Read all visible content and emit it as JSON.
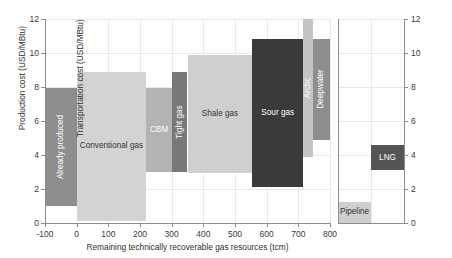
{
  "chart_data": {
    "type": "bar",
    "title": "",
    "subtitle": "",
    "panels": [
      {
        "name": "production-cost-panel",
        "xlabel": "Remaining technically recoverable gas resources (tcm)",
        "ylabel": "Production cost (USD/MBtu)",
        "xlim": [
          -100,
          800
        ],
        "ylim": [
          0,
          12
        ],
        "xticks": [
          "-100",
          "0",
          "100",
          "200",
          "300",
          "400",
          "500",
          "600",
          "700",
          "800"
        ],
        "xtick_values": [
          -100,
          0,
          100,
          200,
          300,
          400,
          500,
          600,
          700,
          800
        ],
        "yticks": [
          "0",
          "2",
          "4",
          "6",
          "8",
          "10",
          "12"
        ],
        "ytick_values": [
          0,
          2,
          4,
          6,
          8,
          10,
          12
        ],
        "grid": true,
        "legend": "none",
        "note": "Horizontal extent = cumulative resource volume (tcm); vertical extent = production cost range (USD/MBtu)",
        "bars": [
          {
            "label": "Already produced",
            "x_start": -100,
            "x_end": 0,
            "cost_low": 1.0,
            "cost_high": 7.95,
            "color": "#8e8e8e",
            "label_color": "#ffffff",
            "label_orientation": "vertical"
          },
          {
            "label": "Conventional gas",
            "x_start": 0,
            "x_end": 220,
            "cost_low": 0.1,
            "cost_high": 8.9,
            "color": "#d3d3d3",
            "label_color": "#333333",
            "label_orientation": "horizontal"
          },
          {
            "label": "CBM",
            "x_start": 220,
            "x_end": 300,
            "cost_low": 3.0,
            "cost_high": 7.95,
            "color": "#b3b3b3",
            "label_color": "#ffffff",
            "label_orientation": "horizontal"
          },
          {
            "label": "Tight gas",
            "x_start": 300,
            "x_end": 350,
            "cost_low": 3.0,
            "cost_high": 8.9,
            "color": "#787878",
            "label_color": "#ffffff",
            "label_orientation": "vertical"
          },
          {
            "label": "Shale gas",
            "x_start": 350,
            "x_end": 555,
            "cost_low": 2.95,
            "cost_high": 9.9,
            "color": "#cfcfcf",
            "label_color": "#333333",
            "label_orientation": "horizontal"
          },
          {
            "label": "Sour gas",
            "x_start": 555,
            "x_end": 715,
            "cost_low": 2.1,
            "cost_high": 10.85,
            "color": "#3a3a3a",
            "label_color": "#ffffff",
            "label_orientation": "horizontal"
          },
          {
            "label": "Arctic",
            "x_start": 715,
            "x_end": 745,
            "cost_low": 3.9,
            "cost_high": 12.0,
            "color": "#c4c4c4",
            "label_color": "#ffffff",
            "label_orientation": "vertical"
          },
          {
            "label": "Deepwater",
            "x_start": 745,
            "x_end": 800,
            "cost_low": 4.9,
            "cost_high": 10.85,
            "color": "#8e8e8e",
            "label_color": "#ffffff",
            "label_orientation": "vertical"
          }
        ]
      },
      {
        "name": "transportation-cost-panel",
        "xlabel": "",
        "ylabel": "Transportation cost (USD/MBtu)",
        "ylim": [
          0,
          12
        ],
        "yticks": [
          "0",
          "2",
          "4",
          "6",
          "8",
          "10",
          "12"
        ],
        "ytick_values": [
          0,
          2,
          4,
          6,
          8,
          10,
          12
        ],
        "grid": true,
        "legend": "none",
        "bars": [
          {
            "label": "Pipeline",
            "slot": 0,
            "cost_low": 0.0,
            "cost_high": 1.25,
            "color": "#cfcfcf",
            "label_color": "#333333",
            "label_orientation": "horizontal"
          },
          {
            "label": "LNG",
            "slot": 1,
            "cost_low": 3.1,
            "cost_high": 4.6,
            "color": "#555555",
            "label_color": "#ffffff",
            "label_orientation": "horizontal"
          }
        ]
      }
    ]
  },
  "axes": {
    "left": {
      "ylabel": "Production cost (USD/MBtu)",
      "xlabel": "Remaining technically recoverable gas resources (tcm)"
    },
    "right": {
      "ylabel": "Transportation cost (USD/MBtu)"
    }
  },
  "colors": {
    "grid": "#e9e9e9",
    "axis": "#8c8c8c",
    "text": "#2f2f2f",
    "background": "#ffffff"
  }
}
